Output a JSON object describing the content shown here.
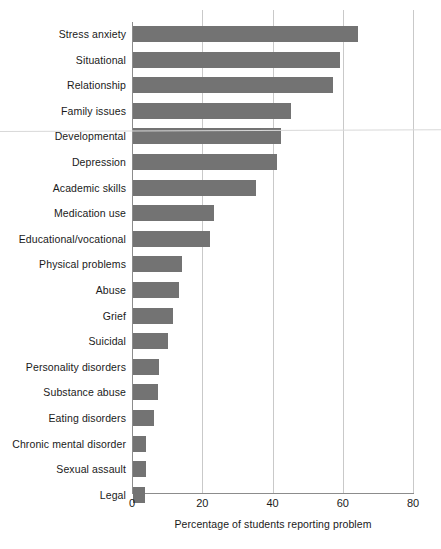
{
  "chart_data": {
    "type": "bar",
    "orientation": "horizontal",
    "title": "",
    "xlabel": "Percentage of students reporting problem",
    "ylabel": "",
    "xlim": [
      0,
      80
    ],
    "xticks": [
      0,
      20,
      40,
      60,
      80
    ],
    "grid": "vertical",
    "legend": "none",
    "bar_color": "#737373",
    "axis_color": "#8c8c8c",
    "grid_color": "#c9c9c9",
    "categories": [
      "Stress anxiety",
      "Situational",
      "Relationship",
      "Family issues",
      "Developmental",
      "Depression",
      "Academic skills",
      "Medication use",
      "Educational/vocational",
      "Physical problems",
      "Abuse",
      "Grief",
      "Suicidal",
      "Personality disorders",
      "Substance abuse",
      "Eating disorders",
      "Chronic mental disorder",
      "Sexual assault",
      "Legal"
    ],
    "values": [
      64,
      59,
      57,
      45,
      42,
      41,
      35,
      23,
      22,
      14,
      13,
      11.5,
      10,
      7.5,
      7,
      6,
      3.8,
      3.7,
      3.4
    ]
  }
}
